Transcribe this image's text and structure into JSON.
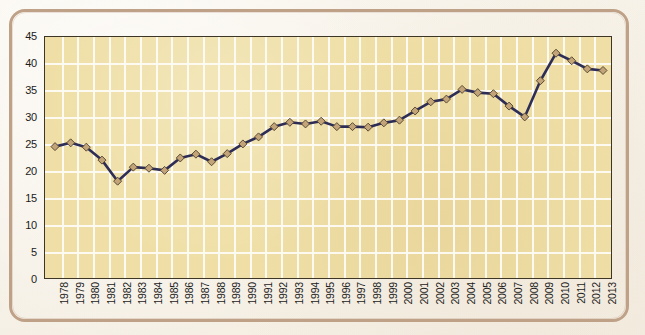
{
  "chart_data": {
    "type": "line",
    "title": "",
    "subtitle": "",
    "xlabel": "",
    "ylabel": "",
    "ylim": [
      0,
      45
    ],
    "ytick_step": 5,
    "yticks": [
      0,
      5,
      10,
      15,
      20,
      25,
      30,
      35,
      40,
      45
    ],
    "grid": true,
    "legend": "none",
    "marker": "diamond",
    "categories": [
      "1978",
      "1979",
      "1980",
      "1981",
      "1982",
      "1983",
      "1984",
      "1985",
      "1986",
      "1987",
      "1988",
      "1989",
      "1990",
      "1991",
      "1992",
      "1993",
      "1994",
      "1995",
      "1996",
      "1997",
      "1998",
      "1999",
      "2000",
      "2001",
      "2002",
      "2003",
      "2004",
      "2005",
      "2006",
      "2007",
      "2008",
      "2009",
      "2010",
      "2011",
      "2012",
      "2013"
    ],
    "values": [
      24.7,
      25.4,
      24.6,
      22.2,
      18.3,
      20.9,
      20.7,
      20.3,
      22.6,
      23.3,
      21.9,
      23.4,
      25.2,
      26.5,
      28.4,
      29.2,
      28.9,
      29.4,
      28.4,
      28.4,
      28.3,
      29.1,
      29.6,
      31.3,
      33.0,
      33.5,
      35.3,
      34.7,
      34.5,
      32.2,
      30.2,
      36.9,
      42.0,
      40.6,
      39.1,
      38.8
    ],
    "series": [
      {
        "name": "series-1",
        "values": [
          24.7,
          25.4,
          24.6,
          22.2,
          18.3,
          20.9,
          20.7,
          20.3,
          22.6,
          23.3,
          21.9,
          23.4,
          25.2,
          26.5,
          28.4,
          29.2,
          28.9,
          29.4,
          28.4,
          28.4,
          28.3,
          29.1,
          29.6,
          31.3,
          33.0,
          33.5,
          35.3,
          34.7,
          34.5,
          32.2,
          30.2,
          36.9,
          42.0,
          40.6,
          39.1,
          38.8
        ]
      }
    ],
    "colors": {
      "line": "#2e2d56",
      "marker_fill": "#c2a478",
      "marker_edge": "#5a4a35",
      "plot_background": "#efdfa6",
      "gridline": "#fdfbf4",
      "axis": "#3d3526",
      "frame": "#bfa188",
      "page_background": "#f6f1e7",
      "text": "#1b1b1b"
    }
  }
}
